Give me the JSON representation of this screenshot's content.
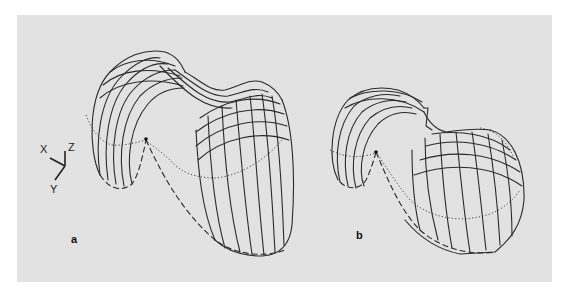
{
  "figure": {
    "panels": [
      {
        "id": "a",
        "label": "a",
        "description": "3D wireframe surface with two lobes connected by a saddle; dotted lower contour and dashed boundary curve"
      },
      {
        "id": "b",
        "label": "b",
        "description": "3D wireframe surface variant with smaller left lobe and elongated right lobe"
      }
    ],
    "axes_indicator": {
      "x_label": "X",
      "y_label": "Y",
      "z_label": "Z"
    },
    "colors": {
      "panel_background": "#e2e2e2",
      "page_background": "#ffffff",
      "line_color": "#2a2a2a"
    }
  }
}
